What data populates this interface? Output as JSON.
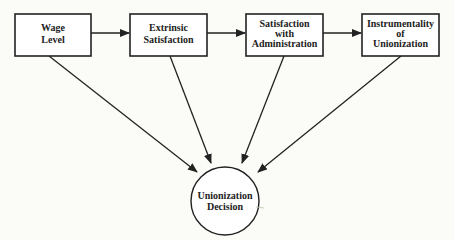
{
  "diagram": {
    "type": "path-model",
    "nodes": [
      {
        "id": "wage",
        "shape": "box",
        "lines": [
          "Wage",
          "Level"
        ]
      },
      {
        "id": "extrinsic",
        "shape": "box",
        "lines": [
          "Extrinsic",
          "Satisfaction"
        ]
      },
      {
        "id": "admin",
        "shape": "box",
        "lines": [
          "Satisfaction",
          "with",
          "Administration"
        ]
      },
      {
        "id": "instrumentality",
        "shape": "box",
        "lines": [
          "Instrumentality",
          "of",
          "Unionization"
        ]
      },
      {
        "id": "decision",
        "shape": "circle",
        "lines": [
          "Unionization",
          "Decision"
        ]
      }
    ],
    "edges": [
      {
        "from": "wage",
        "to": "extrinsic"
      },
      {
        "from": "extrinsic",
        "to": "admin"
      },
      {
        "from": "admin",
        "to": "instrumentality"
      },
      {
        "from": "wage",
        "to": "decision"
      },
      {
        "from": "extrinsic",
        "to": "decision"
      },
      {
        "from": "admin",
        "to": "decision"
      },
      {
        "from": "instrumentality",
        "to": "decision"
      }
    ],
    "colors": {
      "stroke": "#222222",
      "background": "#fbfbf8"
    }
  }
}
